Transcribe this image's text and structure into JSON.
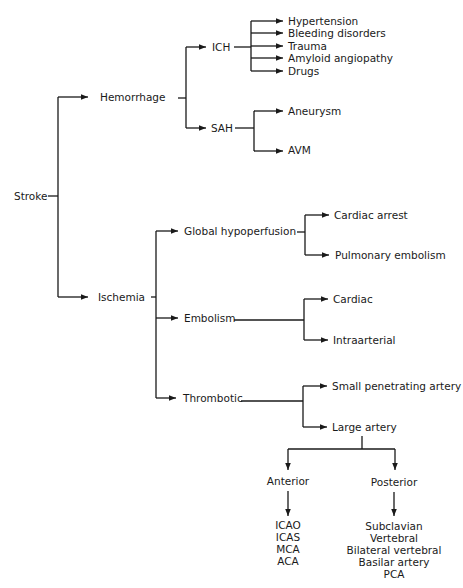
{
  "diagram": {
    "type": "tree",
    "root": "Stroke",
    "nodes": {
      "stroke": "Stroke",
      "hemorrhage": "Hemorrhage",
      "ich": "ICH",
      "ich_causes": [
        "Hypertension",
        "Bleeding disorders",
        "Trauma",
        "Amyloid angiopathy",
        "Drugs"
      ],
      "sah": "SAH",
      "sah_causes": [
        "Aneurysm",
        "AVM"
      ],
      "ischemia": "Ischemia",
      "global_hypoperfusion": "Global hypoperfusion",
      "global_causes": [
        "Cardiac arrest",
        "Pulmonary embolism"
      ],
      "embolism": "Embolism",
      "embolism_causes": [
        "Cardiac",
        "Intraarterial"
      ],
      "thrombotic": "Thrombotic",
      "thrombotic_causes": [
        "Small penetrating artery",
        "Large artery"
      ],
      "anterior": "Anterior",
      "anterior_vessels": [
        "ICAO",
        "ICAS",
        "MCA",
        "ACA"
      ],
      "posterior": "Posterior",
      "posterior_vessels": [
        "Subclavian",
        "Vertebral",
        "Bilateral vertebral",
        "Basilar artery",
        "PCA"
      ]
    },
    "colors": {
      "line": "#1a1a1a",
      "background": "#ffffff"
    }
  }
}
